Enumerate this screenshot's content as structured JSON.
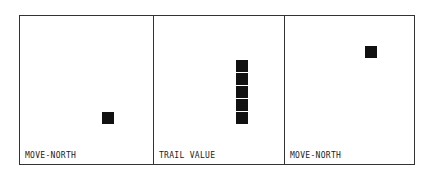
{
  "panels": [
    {
      "label": "MOVE-NORTH",
      "cells": [
        {
          "x": 82,
          "y": 96
        }
      ]
    },
    {
      "label": "TRAIL VALUE",
      "cells": [
        {
          "x": 82,
          "y": 44
        },
        {
          "x": 82,
          "y": 57
        },
        {
          "x": 82,
          "y": 70
        },
        {
          "x": 82,
          "y": 83
        },
        {
          "x": 82,
          "y": 96
        }
      ]
    },
    {
      "label": "MOVE-NORTH",
      "cells": [
        {
          "x": 80,
          "y": 30
        }
      ]
    }
  ],
  "colors": {
    "border": "#333333",
    "cell": "#111111",
    "background": "#ffffff"
  }
}
